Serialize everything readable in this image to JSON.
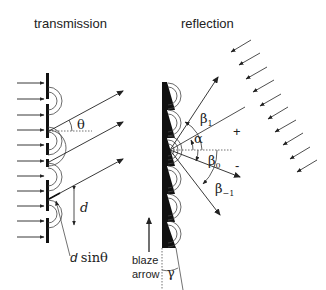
{
  "figure": {
    "panels": [
      {
        "name": "transmission",
        "title": "transmission",
        "labels": {
          "angle": "θ",
          "spacing": "d",
          "path_difference_var": "d",
          "path_difference_fn": "sinθ"
        }
      },
      {
        "name": "reflection",
        "title": "reflection",
        "labels": {
          "beta_plus1": "β",
          "beta_plus1_sub": "1",
          "alpha": "α",
          "beta_zero": "β",
          "beta_zero_sub": "0",
          "beta_minus1": "β",
          "beta_minus1_sub": "−1",
          "plus_sign": "+",
          "minus_sign": "-",
          "gamma": "γ",
          "blaze_line1": "blaze",
          "blaze_line2": "arrow"
        }
      }
    ],
    "colors": {
      "ink": "#222222",
      "grating": "#111111",
      "background": "#ffffff"
    }
  }
}
